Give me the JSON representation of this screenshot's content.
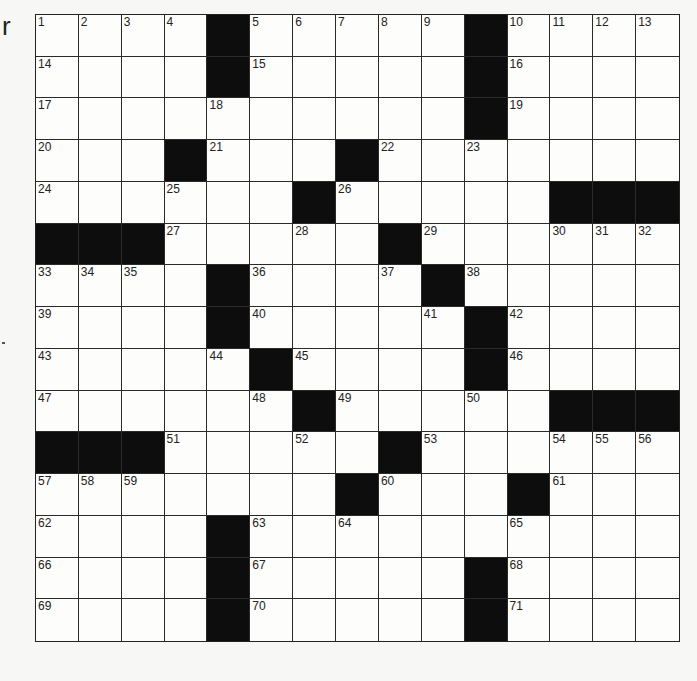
{
  "margin": {
    "fragment_text": "r"
  },
  "puzzle": {
    "rows": 15,
    "cols": 15,
    "colors": {
      "black_square": "#0d0d0d",
      "white_square": "#fdfdfb",
      "grid_line": "#2a2a2a",
      "background": "#f7f7f5"
    },
    "grid": [
      [
        "1",
        "2",
        "3",
        "4",
        "#",
        "5",
        "6",
        "7",
        "8",
        "9",
        "#",
        "10",
        "11",
        "12",
        "13"
      ],
      [
        "14",
        ".",
        ".",
        ".",
        "#",
        "15",
        ".",
        ".",
        ".",
        ".",
        "#",
        "16",
        ".",
        ".",
        "."
      ],
      [
        "17",
        ".",
        ".",
        ".",
        "18",
        ".",
        ".",
        ".",
        ".",
        ".",
        "#",
        "19",
        ".",
        ".",
        "."
      ],
      [
        "20",
        ".",
        ".",
        "#",
        "21",
        ".",
        ".",
        "#",
        "22",
        ".",
        "23",
        ".",
        ".",
        ".",
        "."
      ],
      [
        "24",
        ".",
        ".",
        "25",
        ".",
        ".",
        "#",
        "26",
        ".",
        ".",
        ".",
        ".",
        "#",
        "#",
        "#"
      ],
      [
        "#",
        "#",
        "#",
        "27",
        ".",
        ".",
        "28",
        ".",
        "#",
        "29",
        ".",
        ".",
        "30",
        "31",
        "32"
      ],
      [
        "33",
        "34",
        "35",
        ".",
        "#",
        "36",
        ".",
        ".",
        "37",
        "#",
        "38",
        ".",
        ".",
        ".",
        "."
      ],
      [
        "39",
        ".",
        ".",
        ".",
        "#",
        "40",
        ".",
        ".",
        ".",
        "41",
        "#",
        "42",
        ".",
        ".",
        "."
      ],
      [
        "43",
        ".",
        ".",
        ".",
        "44",
        "#",
        "45",
        ".",
        ".",
        ".",
        "#",
        "46",
        ".",
        ".",
        "."
      ],
      [
        "47",
        ".",
        ".",
        ".",
        ".",
        "48",
        "#",
        "49",
        ".",
        ".",
        "50",
        ".",
        "#",
        "#",
        "#"
      ],
      [
        "#",
        "#",
        "#",
        "51",
        ".",
        ".",
        "52",
        ".",
        "#",
        "53",
        ".",
        ".",
        "54",
        "55",
        "56"
      ],
      [
        "57",
        "58",
        "59",
        ".",
        ".",
        ".",
        ".",
        "#",
        "60",
        ".",
        ".",
        "#",
        "61",
        ".",
        "."
      ],
      [
        "62",
        ".",
        ".",
        ".",
        "#",
        "63",
        ".",
        "64",
        ".",
        ".",
        ".",
        "65",
        ".",
        ".",
        "."
      ],
      [
        "66",
        ".",
        ".",
        ".",
        "#",
        "67",
        ".",
        ".",
        ".",
        ".",
        "#",
        "68",
        ".",
        ".",
        "."
      ],
      [
        "69",
        ".",
        ".",
        ".",
        "#",
        "70",
        ".",
        ".",
        ".",
        ".",
        "#",
        "71",
        ".",
        ".",
        "."
      ]
    ]
  }
}
